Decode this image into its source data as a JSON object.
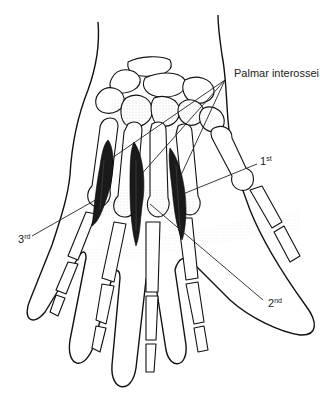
{
  "figure": {
    "labels": {
      "main": "Palmar interossei",
      "first": {
        "num": "1",
        "suffix": "st"
      },
      "second": {
        "num": "2",
        "suffix": "nd"
      },
      "third": {
        "num": "3",
        "suffix": "rd"
      }
    },
    "colors": {
      "line": "#111111",
      "muscle": "#1a1a1a",
      "background": "#ffffff"
    }
  }
}
